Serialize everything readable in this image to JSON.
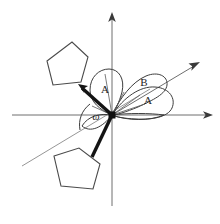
{
  "figure": {
    "background_color": "#ffffff",
    "width": 220,
    "height": 224
  },
  "colors": {
    "axis": "#6e6e6e",
    "arrowhead": "#3a3a3a",
    "ring_stroke": "#4a4a4a",
    "bond": "#141414",
    "lobe_stroke": "#3d3d3d",
    "reference_line": "#8a8a8a",
    "label_text": "#1d1d1d"
  },
  "origin": {
    "x": 112,
    "y": 115,
    "label": "origin-vertex"
  },
  "axes": [
    {
      "name": "vertical-axis",
      "from": [
        112,
        206
      ],
      "to": [
        112,
        14
      ],
      "arrow": true,
      "arrow_at": "top"
    },
    {
      "name": "horizontal-axis",
      "from": [
        12,
        115
      ],
      "to": [
        212,
        115
      ],
      "arrow": true,
      "arrow_at": "right"
    },
    {
      "name": "diagonal-axis",
      "from": [
        112,
        115
      ],
      "to": [
        198,
        63
      ],
      "arrow": true,
      "arrow_at": "upper-right"
    }
  ],
  "reference_line": {
    "name": "projection-reference-line",
    "from": [
      22,
      165
    ],
    "to": [
      150,
      89
    ]
  },
  "rings": [
    {
      "name": "upper-left-pentagon",
      "points": "47,61 72,42 88,57 81,82 53,85"
    },
    {
      "name": "lower-left-pentagon",
      "points": "54,156 79,148 100,164 93,189 61,186"
    }
  ],
  "bonds": [
    {
      "name": "upper-bond",
      "from": [
        112,
        115
      ],
      "to": [
        80,
        86
      ],
      "arrowhead": true
    },
    {
      "name": "lower-bond",
      "from": [
        112,
        115
      ],
      "to": [
        92,
        156
      ],
      "arrowhead": false
    }
  ],
  "angle_arcs": [
    {
      "name": "arc-upper-A",
      "label": "A",
      "label_x": 105,
      "label_y": 90,
      "path": "M 112,115 C 102,112 92,104 92,92 C 92,79 101,70 110,70 C 119,70 124,80 121,92 C 118,104 114,112 112,115 Z"
    },
    {
      "name": "arc-right-A",
      "label": "A",
      "label_x": 148,
      "label_y": 100
    },
    {
      "name": "arc-right-B",
      "label": "B",
      "label_x": 144,
      "label_y": 83
    },
    {
      "name": "arc-omega",
      "label": "ω",
      "label_x": 96,
      "label_y": 117
    }
  ],
  "labels": {
    "upper_A": "A",
    "right_A": "A",
    "right_B": "B",
    "omega": "ω"
  }
}
